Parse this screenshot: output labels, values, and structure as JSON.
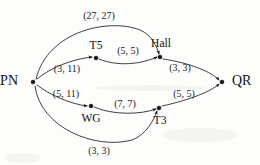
{
  "figure": {
    "background_color": "#fdfdfc",
    "ink_color": "#111111",
    "width": 260,
    "height": 165
  },
  "graph": {
    "type": "directed-network",
    "source_node": "PN",
    "sink_node": "QR",
    "nodes": [
      {
        "id": "PN",
        "label": "PN",
        "x": 33,
        "y": 82,
        "label_x": 18,
        "label_y": 82,
        "anchor": "end",
        "size": "big"
      },
      {
        "id": "T5",
        "label": "T5",
        "x": 96,
        "y": 58,
        "label_x": 96,
        "label_y": 46,
        "anchor": "middle",
        "size": "normal"
      },
      {
        "id": "Hall",
        "label": "Hall",
        "x": 160,
        "y": 57,
        "label_x": 161,
        "label_y": 44,
        "anchor": "middle",
        "size": "normal"
      },
      {
        "id": "WG",
        "label": "WG",
        "x": 91,
        "y": 106,
        "label_x": 91,
        "label_y": 119,
        "anchor": "middle",
        "size": "normal"
      },
      {
        "id": "T3",
        "label": "T3",
        "x": 159,
        "y": 108,
        "label_x": 160,
        "label_y": 121,
        "anchor": "middle",
        "size": "normal"
      },
      {
        "id": "QR",
        "label": "QR",
        "x": 222,
        "y": 82,
        "label_x": 232,
        "label_y": 82,
        "anchor": "start",
        "size": "big"
      }
    ],
    "edges": [
      {
        "id": "pn-hall-top",
        "from": "PN",
        "to": "Hall",
        "label": "(27, 27)",
        "values": [
          27,
          27
        ],
        "label_x": 99,
        "label_y": 17,
        "path": "M 36 79 C 48 30, 110 18, 140 30 C 152 35, 157 47, 159 54"
      },
      {
        "id": "pn-t5",
        "from": "PN",
        "to": "T5",
        "label": "(3, 11)",
        "values": [
          3,
          11
        ],
        "label_x": 67,
        "label_y": 70,
        "path": "M 37 79 C 50 68, 72 59, 92 57"
      },
      {
        "id": "t5-hall",
        "from": "T5",
        "to": "Hall",
        "label": "(5, 5)",
        "values": [
          5,
          5
        ],
        "label_x": 128,
        "label_y": 52,
        "path": "M 99 59 C 118 67, 142 64, 157 57"
      },
      {
        "id": "hall-qr",
        "from": "Hall",
        "to": "QR",
        "label": "(3, 3)",
        "values": [
          3,
          3
        ],
        "label_x": 180,
        "label_y": 69,
        "path": "M 163 59 C 190 63, 212 72, 219 80"
      },
      {
        "id": "pn-wg",
        "from": "PN",
        "to": "WG",
        "label": "(5, 11)",
        "values": [
          5,
          11
        ],
        "label_x": 66,
        "label_y": 95,
        "path": "M 37 85 C 50 95, 70 104, 87 106"
      },
      {
        "id": "wg-t3",
        "from": "WG",
        "to": "T3",
        "label": "(7, 7)",
        "values": [
          7,
          7
        ],
        "label_x": 125,
        "label_y": 105,
        "path": "M 94 107 C 112 115, 140 115, 156 109"
      },
      {
        "id": "t3-qr",
        "from": "T3",
        "to": "QR",
        "label": "(5, 5)",
        "values": [
          5,
          5
        ],
        "label_x": 184,
        "label_y": 95,
        "path": "M 162 106 C 190 100, 212 91, 219 84"
      },
      {
        "id": "pn-t3-bottom",
        "from": "PN",
        "to": "T3",
        "label": "(3, 3)",
        "values": [
          3,
          3
        ],
        "label_x": 99,
        "label_y": 152,
        "path": "M 35 86 C 40 128, 96 150, 132 140 C 146 135, 154 120, 157 111"
      }
    ]
  }
}
